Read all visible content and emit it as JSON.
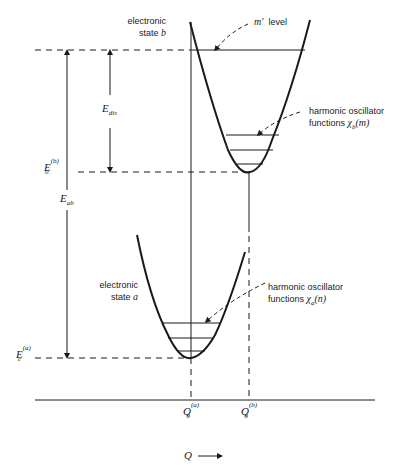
{
  "diagram": {
    "type": "potential-energy-curves",
    "states": {
      "b": {
        "label_line1": "electronic",
        "label_line2_prefix": "state ",
        "label_line2_var": "b",
        "level_label_var": "m′",
        "level_label_text": "level",
        "oscillator_line1": "harmonic oscillator",
        "oscillator_line2_prefix": "functions ",
        "oscillator_line2_var": "χ",
        "oscillator_line2_sub": "b",
        "oscillator_line2_arg": "(m)"
      },
      "a": {
        "label_line1": "electronic",
        "label_line2_prefix": "state ",
        "label_line2_var": "a",
        "oscillator_line1": "harmonic oscillator",
        "oscillator_line2_prefix": "functions ",
        "oscillator_line2_var": "χ",
        "oscillator_line2_sub": "a",
        "oscillator_line2_arg": "(n)"
      }
    },
    "energies": {
      "E_dis": {
        "base": "E",
        "sub": "dis"
      },
      "E_ab": {
        "base": "E",
        "sub": "ab"
      },
      "E0_b": {
        "base": "E",
        "sub": "0",
        "sup": "(b)"
      },
      "Ec_a": {
        "base": "E",
        "sub": "c",
        "sup": "(a)"
      }
    },
    "axis": {
      "Q0_a": {
        "base": "Q",
        "sub": "0",
        "sup": "(a)"
      },
      "Q0_b": {
        "base": "Q",
        "sub": "0",
        "sup": "(b)"
      },
      "x_label": "Q",
      "arrow": "→"
    },
    "colors": {
      "ink": "#1a1a1a",
      "background": "#ffffff"
    }
  }
}
